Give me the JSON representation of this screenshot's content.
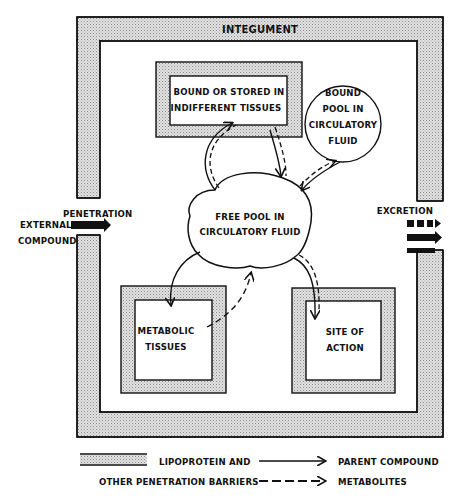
{
  "diagram": {
    "title": "INTEGUMENT",
    "nodes": {
      "bound_stored": {
        "line1": "BOUND OR STORED IN",
        "line2": "INDIFFERENT TISSUES"
      },
      "bound_pool": {
        "line1": "BOUND",
        "line2": "POOL IN",
        "line3": "CIRCULATORY",
        "line4": "FLUID"
      },
      "free_pool": {
        "line1": "FREE POOL IN",
        "line2": "CIRCULATORY FLUID"
      },
      "metabolic": {
        "line1": "METABOLIC",
        "line2": "TISSUES"
      },
      "site_action": {
        "line1": "SITE OF",
        "line2": "ACTION"
      }
    },
    "input": {
      "label_top": "PENETRATION",
      "label_left1": "EXTERNAL",
      "label_left2": "COMPOUND"
    },
    "output": {
      "label": "EXCRETION"
    },
    "legend": {
      "barrier_line1": "LIPOPROTEIN AND",
      "barrier_line2": "OTHER PENETRATION BARRIERS",
      "parent": "PARENT COMPOUND",
      "metabolites": "METABOLITES"
    },
    "colors": {
      "ink": "#111111",
      "stipple": "#d4d4d4",
      "background": "#ffffff"
    }
  }
}
